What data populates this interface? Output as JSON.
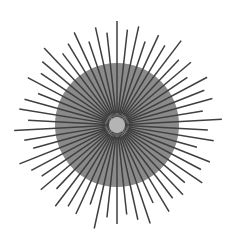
{
  "figure": {
    "title": "Radial starburst",
    "type": "starburst",
    "canvas": {
      "width": 230,
      "height": 241,
      "background_color": "#ffffff"
    },
    "center": {
      "x": 117,
      "y": 125
    },
    "disc": {
      "name": "outer-gray-disc",
      "radius": 62,
      "color": "#8a8a8a"
    },
    "core": {
      "name": "inner-light-core",
      "radius": 12,
      "color": "#b4b4b4"
    },
    "rays": {
      "count": 58,
      "color": "#3f3f3f",
      "stroke_width": 1.5,
      "inner_radius": 10,
      "outer_radius_min": 82,
      "outer_radius_max": 106,
      "angle_offset_deg": -90
    }
  },
  "chart_data": {
    "type": "scatter",
    "title": "Radial starburst",
    "xlabel": "",
    "ylabel": "",
    "categories": [],
    "values": [],
    "ray_lengths": [
      104,
      96,
      101,
      88,
      99,
      93,
      106,
      90,
      97,
      85,
      102,
      94,
      99,
      87,
      105,
      91,
      98,
      83,
      100,
      95,
      103,
      89,
      96,
      92,
      101,
      86,
      104,
      97,
      90,
      99,
      93,
      106,
      84,
      98,
      95,
      102,
      88,
      100,
      91,
      97,
      105,
      87,
      94,
      103,
      89,
      99,
      96,
      85,
      101,
      92,
      98,
      106,
      90,
      95,
      102,
      88,
      100,
      93
    ],
    "legend": [],
    "grid": false
  }
}
